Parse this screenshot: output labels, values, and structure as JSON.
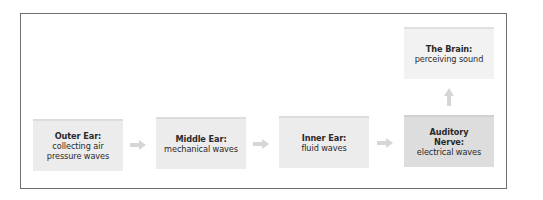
{
  "diagram": {
    "type": "flow",
    "direction": "left-to-right-then-up",
    "colors": {
      "frame_border": "#6f6f6f",
      "box_fill": "#ececec",
      "box_fill_highlight": "#dddddd",
      "box_fill_final": "#f2f2f2",
      "arrow": "#d6d6d6",
      "text": "#2a2a2a"
    },
    "nodes": [
      {
        "id": "outer-ear",
        "title": "Outer Ear:",
        "lines": [
          "collecting air",
          "pressure waves"
        ]
      },
      {
        "id": "middle-ear",
        "title": "Middle Ear:",
        "lines": [
          "mechanical waves"
        ]
      },
      {
        "id": "inner-ear",
        "title": "Inner Ear:",
        "lines": [
          "fluid waves"
        ]
      },
      {
        "id": "auditory-nerve",
        "title_lines": [
          "Auditory",
          "Nerve:"
        ],
        "lines": [
          "electrical waves"
        ]
      },
      {
        "id": "brain",
        "title": "The Brain:",
        "lines": [
          "perceiving sound"
        ]
      }
    ],
    "edges": [
      {
        "from": "outer-ear",
        "to": "middle-ear",
        "arrow": "right"
      },
      {
        "from": "middle-ear",
        "to": "inner-ear",
        "arrow": "right"
      },
      {
        "from": "inner-ear",
        "to": "auditory-nerve",
        "arrow": "right"
      },
      {
        "from": "auditory-nerve",
        "to": "brain",
        "arrow": "up"
      }
    ]
  }
}
